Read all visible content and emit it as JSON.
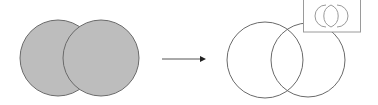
{
  "diagram": {
    "before": {
      "circles": [
        {
          "cx": 58,
          "cy": 58,
          "r": 38
        },
        {
          "cx": 101,
          "cy": 58,
          "r": 38
        }
      ],
      "fill": "#bdbdbd",
      "stroke": "#6a6a6a"
    },
    "arrow": {
      "x1": 162,
      "y1": 59,
      "x2": 205,
      "y2": 59,
      "color": "#333333"
    },
    "after": {
      "circles": [
        {
          "cx": 265,
          "cy": 60,
          "r": 38
        },
        {
          "cx": 308,
          "cy": 60,
          "r": 37
        }
      ],
      "fill": "none",
      "stroke": "#6a6a6a"
    },
    "inset": {
      "x": 303,
      "y": 0,
      "width": 58,
      "height": 32,
      "stroke": "#9a9a9a",
      "shapes": [
        "left-crescent",
        "lens",
        "right-crescent"
      ]
    }
  }
}
